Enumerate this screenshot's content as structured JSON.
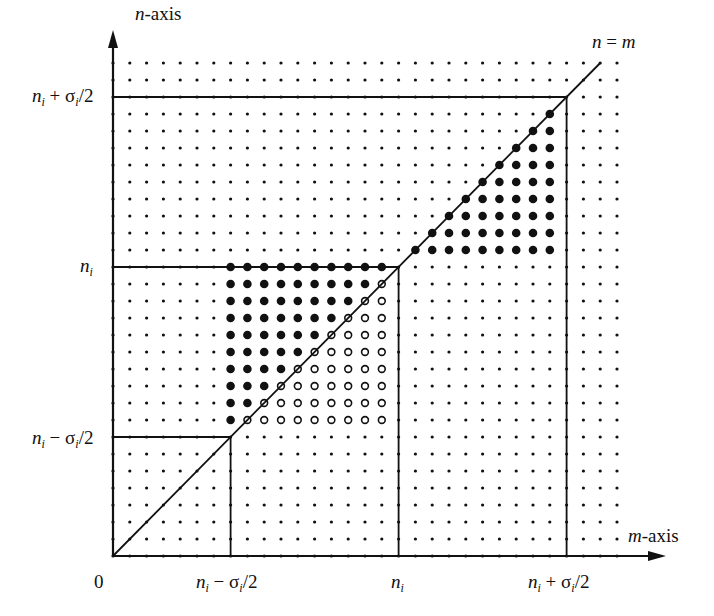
{
  "diagram": {
    "axes": {
      "x_label": "m-axis",
      "y_label": "n-axis",
      "origin_label": "0",
      "diagonal_label": "n = m"
    },
    "ticks": {
      "x": [
        {
          "value": 7,
          "label": "n_i − σ_i/2"
        },
        {
          "value": 17,
          "label": "n_i"
        },
        {
          "value": 27,
          "label": "n_i + σ_i/2"
        }
      ],
      "y": [
        {
          "value": 7,
          "label": "n_i − σ_i/2"
        },
        {
          "value": 17,
          "label": "n_i"
        },
        {
          "value": 27,
          "label": "n_i + σ_i/2"
        }
      ]
    },
    "grid": {
      "m_max": 30,
      "n_max": 29,
      "origin_px": [
        113,
        556
      ],
      "step_x_px": 16.8,
      "step_y_px": 17.0
    },
    "regions": [
      {
        "name": "lower-left-filled",
        "style": "filled",
        "rule": "7 <= m <= 16, m < n <= 17"
      },
      {
        "name": "lower-left-hollow",
        "style": "hollow",
        "rule": "8 <= n <= 16, n <= m <= 16"
      },
      {
        "name": "upper-right-filled",
        "style": "filled",
        "rule": "18 <= n <= 26, n <= m <= 26"
      }
    ],
    "diagonal_end": 29,
    "colors": {
      "ink": "#111111",
      "background": "#ffffff"
    }
  }
}
